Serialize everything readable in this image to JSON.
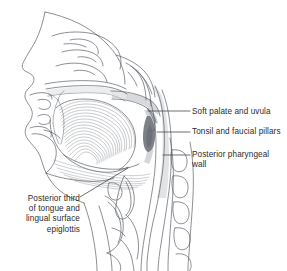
{
  "figure": {
    "background_color": "#ffffff",
    "line_color": "#5a5f66",
    "text_color": "#2b2b2b",
    "shade_light": "#d8dadd",
    "shade_mid": "#b9bcc1",
    "shade_dark": "#7e8288",
    "width": 287,
    "height": 271
  },
  "labels": {
    "soft_palate": {
      "text": "Soft palate and uvula",
      "leader": {
        "x1": 148,
        "y1": 111,
        "x2": 190,
        "y2": 111
      }
    },
    "tonsil": {
      "text": "Tonsil and faucial pillars",
      "leader": {
        "x1": 157,
        "y1": 132,
        "x2": 190,
        "y2": 132
      }
    },
    "posterior_wall": {
      "text": "Posterior pharyngeal\nwall",
      "leader": {
        "x1": 163,
        "y1": 155,
        "x2": 190,
        "y2": 155
      }
    },
    "tongue_base": {
      "text": "Posterior third\nof tongue and\nlingual surface\nepiglottis",
      "leader": {
        "x1": 80,
        "y1": 197,
        "x2": 128,
        "y2": 168
      }
    }
  },
  "structures": [
    {
      "name": "facial-profile",
      "kind": "outline"
    },
    {
      "name": "nasal-cavity-turbinates",
      "kind": "outline"
    },
    {
      "name": "hard-palate",
      "kind": "outline"
    },
    {
      "name": "soft-palate-uvula",
      "kind": "shaded",
      "shade": "#d8dadd"
    },
    {
      "name": "oral-cavity-tongue",
      "kind": "hatched"
    },
    {
      "name": "palatine-tonsil",
      "kind": "shaded",
      "shade": "#7e8288"
    },
    {
      "name": "posterior-pharyngeal-wall",
      "kind": "shaded",
      "shade": "#d8dadd"
    },
    {
      "name": "epiglottis",
      "kind": "outline"
    },
    {
      "name": "hyoid-and-laryngeal-cartilage",
      "kind": "outline"
    },
    {
      "name": "cervical-vertebrae",
      "kind": "outline"
    },
    {
      "name": "mandible",
      "kind": "outline"
    },
    {
      "name": "neck-contour",
      "kind": "outline"
    }
  ]
}
